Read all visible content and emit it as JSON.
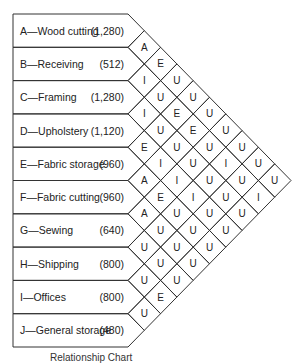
{
  "chart_data": {
    "type": "table",
    "title": "Relationship Chart",
    "departments": [
      {
        "code": "A",
        "name": "Wood cutting",
        "area": "(1,280)"
      },
      {
        "code": "B",
        "name": "Receiving",
        "area": "(512)"
      },
      {
        "code": "C",
        "name": "Framing",
        "area": "(1,280)"
      },
      {
        "code": "D",
        "name": "Upholstery",
        "area": "(1,120)"
      },
      {
        "code": "E",
        "name": "Fabric storage",
        "area": "(960)"
      },
      {
        "code": "F",
        "name": "Fabric cutting",
        "area": "(960)"
      },
      {
        "code": "G",
        "name": "Sewing",
        "area": "(640)"
      },
      {
        "code": "H",
        "name": "Shipping",
        "area": "(800)"
      },
      {
        "code": "I",
        "name": "Offices",
        "area": "(800)"
      },
      {
        "code": "J",
        "name": "General storage",
        "area": "(480)"
      }
    ],
    "relationships": {
      "A-B": "A",
      "A-C": "E",
      "A-D": "U",
      "A-E": "U",
      "A-F": "U",
      "A-G": "U",
      "A-H": "U",
      "A-I": "U",
      "A-J": "U",
      "B-C": "I",
      "B-D": "U",
      "B-E": "E",
      "B-F": "E",
      "B-G": "U",
      "B-H": "I",
      "B-I": "U",
      "B-J": "I",
      "C-D": "I",
      "C-E": "U",
      "C-F": "U",
      "C-G": "U",
      "C-H": "U",
      "C-I": "U",
      "C-J": "U",
      "D-E": "E",
      "D-F": "I",
      "D-G": "I",
      "D-H": "I",
      "D-I": "U",
      "D-J": "U",
      "E-F": "A",
      "E-G": "E",
      "E-H": "U",
      "E-I": "U",
      "E-J": "U",
      "F-G": "A",
      "F-H": "U",
      "F-I": "U",
      "F-J": "U",
      "G-H": "U",
      "G-I": "U",
      "G-J": "U",
      "H-I": "U",
      "H-J": "E",
      "I-J": "U"
    }
  },
  "caption": "Relationship Chart"
}
